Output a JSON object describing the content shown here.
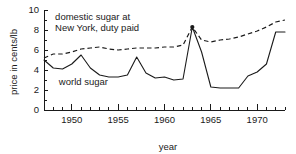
{
  "chart_data": {
    "type": "line",
    "title": "",
    "xlabel": "year",
    "ylabel": "price in cents/lb",
    "xlim": [
      1947,
      1973
    ],
    "ylim": [
      0,
      10
    ],
    "ytick_labels": [
      "0",
      "2",
      "4",
      "6",
      "8",
      "10"
    ],
    "ytick_values": [
      0,
      2,
      4,
      6,
      8,
      10
    ],
    "xtick_labels": [
      "1950",
      "1955",
      "1960",
      "1965",
      "1970"
    ],
    "xtick_values": [
      1950,
      1955,
      1960,
      1965,
      1970
    ],
    "xtick_minor_step": 1,
    "grid": false,
    "legend": "annotations",
    "annotations": [
      {
        "name": "domestic-series-label",
        "line1": "domestic sugar at",
        "line2": "New York, duty paid",
        "x": 1948.2,
        "y": 9.0
      },
      {
        "name": "world-series-label",
        "line1": "world sugar",
        "x": 1948.6,
        "y": 2.5
      }
    ],
    "x": [
      1947,
      1948,
      1949,
      1950,
      1951,
      1952,
      1953,
      1954,
      1955,
      1956,
      1957,
      1958,
      1959,
      1960,
      1961,
      1962,
      1963,
      1964,
      1965,
      1966,
      1967,
      1968,
      1969,
      1970,
      1971,
      1972,
      1973
    ],
    "series": [
      {
        "name": "world sugar",
        "style": "solid",
        "values": [
          5.0,
          4.2,
          4.1,
          4.6,
          5.5,
          4.2,
          3.5,
          3.3,
          3.3,
          3.5,
          5.3,
          3.7,
          3.2,
          3.3,
          3.0,
          3.1,
          8.3,
          5.8,
          2.3,
          2.2,
          2.2,
          2.2,
          3.4,
          3.8,
          4.6,
          7.8,
          7.8
        ]
      },
      {
        "name": "domestic sugar at New York, duty paid",
        "style": "dashed",
        "values": [
          5.2,
          5.6,
          5.6,
          5.8,
          6.1,
          6.2,
          6.3,
          6.1,
          6.0,
          6.1,
          6.2,
          6.2,
          6.2,
          6.3,
          6.3,
          6.5,
          8.3,
          7.0,
          6.8,
          7.0,
          7.1,
          7.3,
          7.6,
          7.9,
          8.3,
          8.8,
          9.0
        ]
      }
    ],
    "markers": [
      {
        "name": "peak-1963",
        "x": 1963,
        "y": 8.3
      }
    ]
  }
}
